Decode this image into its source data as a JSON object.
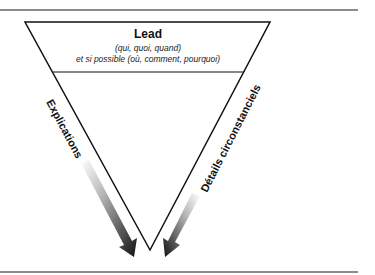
{
  "diagram": {
    "type": "inverted-pyramid",
    "lead": {
      "title": "Lead",
      "line1": "(qui, quoi, quand)",
      "line2": "et si possible (où, comment, pourquoi)"
    },
    "left_label": "Explications",
    "right_label": "Détails circonstanciels",
    "colors": {
      "stroke": "#111111",
      "rule": "#555555",
      "arrow_dark": "#111111",
      "arrow_light": "#ffffff"
    }
  }
}
